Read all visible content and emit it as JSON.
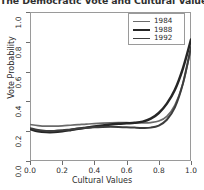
{
  "title": "The Democratic Vote and Cultural Values",
  "axes": {
    "xlabel": "Cultural Values",
    "ylabel": "Vote Probability",
    "xticks": [
      "0.0",
      "0.2",
      "0.4",
      "0.6",
      "0.8",
      "1.0"
    ],
    "yticks": [
      "0.0",
      "0.2",
      "0.4",
      "0.6",
      "0.8",
      "1.0"
    ]
  },
  "legend": {
    "items": [
      {
        "label": "1984",
        "color": "#6b6b6b",
        "width": 1.7
      },
      {
        "label": "1988",
        "color": "#262626",
        "width": 2.4
      },
      {
        "label": "1992",
        "color": "#3d3d3d",
        "width": 1.9
      }
    ]
  },
  "chart_data": {
    "type": "line",
    "title": "The Democratic Vote and Cultural Values",
    "xlabel": "Cultural Values",
    "ylabel": "Vote Probability",
    "xlim": [
      0.0,
      1.0
    ],
    "ylim": [
      0.0,
      1.0
    ],
    "grid": false,
    "legend_position": "top-right",
    "x": [
      0.0,
      0.05,
      0.1,
      0.15,
      0.2,
      0.25,
      0.3,
      0.35,
      0.4,
      0.45,
      0.5,
      0.55,
      0.6,
      0.65,
      0.7,
      0.75,
      0.8,
      0.85,
      0.9,
      0.95,
      1.0
    ],
    "series": [
      {
        "name": "1984",
        "color": "#6b6b6b",
        "values": [
          0.245,
          0.238,
          0.234,
          0.234,
          0.236,
          0.24,
          0.244,
          0.248,
          0.251,
          0.254,
          0.256,
          0.257,
          0.257,
          0.256,
          0.256,
          0.258,
          0.268,
          0.3,
          0.375,
          0.52,
          0.755
        ]
      },
      {
        "name": "1988",
        "color": "#262626",
        "values": [
          0.215,
          0.2,
          0.194,
          0.194,
          0.199,
          0.207,
          0.216,
          0.224,
          0.232,
          0.239,
          0.245,
          0.25,
          0.253,
          0.256,
          0.264,
          0.284,
          0.322,
          0.385,
          0.478,
          0.622,
          0.815
        ]
      },
      {
        "name": "1992",
        "color": "#3d3d3d",
        "values": [
          0.22,
          0.208,
          0.202,
          0.202,
          0.206,
          0.212,
          0.218,
          0.223,
          0.227,
          0.229,
          0.23,
          0.229,
          0.227,
          0.224,
          0.222,
          0.224,
          0.238,
          0.277,
          0.36,
          0.52,
          0.765
        ]
      }
    ]
  }
}
